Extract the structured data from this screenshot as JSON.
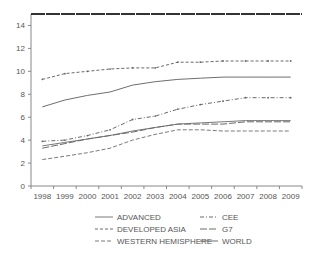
{
  "chart_data": {
    "type": "line",
    "title": "",
    "xlabel": "",
    "ylabel": "",
    "ylim": [
      0,
      15
    ],
    "yticks": [
      "0",
      "2",
      "4",
      "6",
      "8",
      "10",
      "12",
      "14"
    ],
    "categories": [
      "1998",
      "1999",
      "2000",
      "2001",
      "2002",
      "2003",
      "2004",
      "2005",
      "2006",
      "2007",
      "2008",
      "2009"
    ],
    "grid": false,
    "legend_position": "bottom",
    "series": [
      {
        "name": "ADVANCED",
        "style": "solid",
        "color": "#7a7a7a",
        "values": [
          3.5,
          3.8,
          4.1,
          4.4,
          4.8,
          5.1,
          5.4,
          5.5,
          5.6,
          5.7,
          5.7,
          5.7
        ]
      },
      {
        "name": "CEE",
        "style": "dash-dot-marker",
        "color": "#6a6a6a",
        "values": [
          3.9,
          4.0,
          4.4,
          4.9,
          5.8,
          6.1,
          6.7,
          7.1,
          7.4,
          7.7,
          7.7,
          7.7
        ]
      },
      {
        "name": "DEVELOPED ASIA",
        "style": "dash-marker",
        "color": "#6a6a6a",
        "values": [
          9.3,
          9.8,
          10.0,
          10.2,
          10.3,
          10.3,
          10.8,
          10.8,
          10.9,
          10.9,
          10.9,
          10.9
        ]
      },
      {
        "name": "G7",
        "style": "long-dash",
        "color": "#6a6a6a",
        "values": [
          3.3,
          3.7,
          4.1,
          4.4,
          4.7,
          5.1,
          5.4,
          5.4,
          5.4,
          5.6,
          5.6,
          5.6
        ]
      },
      {
        "name": "WESTERN HEMISPHERE",
        "style": "dash",
        "color": "#7a7a7a",
        "values": [
          2.3,
          2.6,
          2.9,
          3.3,
          4.0,
          4.5,
          4.9,
          4.9,
          4.8,
          4.8,
          4.8,
          4.8
        ]
      },
      {
        "name": "WORLD",
        "style": "solid",
        "color": "#6e6e6e",
        "values": [
          6.9,
          7.5,
          7.9,
          8.2,
          8.8,
          9.1,
          9.3,
          9.4,
          9.5,
          9.5,
          9.5,
          9.5
        ]
      }
    ],
    "reference_line": {
      "value": 15,
      "color": "#333333"
    },
    "legend": [
      {
        "label": "ADVANCED",
        "series": 0
      },
      {
        "label": "CEE",
        "series": 1
      },
      {
        "label": "DEVELOPED ASIA",
        "series": 2
      },
      {
        "label": "G7",
        "series": 3
      },
      {
        "label": "WESTERN HEMISPHERE",
        "series": 4
      },
      {
        "label": "WORLD",
        "series": 5
      }
    ]
  }
}
